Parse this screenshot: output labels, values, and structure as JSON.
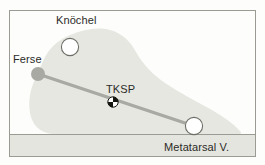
{
  "figure": {
    "kind": "anatomical-diagram",
    "labels": {
      "heel": "Ferse",
      "ankle": "Knöchel",
      "center_of_pressure": "TKSP",
      "metatarsal": "Metatarsal V."
    },
    "markers": [
      {
        "name": "heel-marker",
        "label": "Ferse",
        "style": "filled-circle",
        "x": 38,
        "y": 74,
        "r": 7
      },
      {
        "name": "ankle-marker",
        "label": "Knöchel",
        "style": "open-circle",
        "x": 70,
        "y": 47,
        "r": 9
      },
      {
        "name": "tksp-marker",
        "label": "TKSP",
        "style": "quadrant-circle",
        "x": 113,
        "y": 102,
        "r": 5
      },
      {
        "name": "metatarsal-marker",
        "label": "Metatarsal V.",
        "style": "open-circle",
        "x": 194,
        "y": 126,
        "r": 9
      }
    ],
    "axis_line": {
      "name": "heel-to-metatarsal-axis",
      "x1": 38,
      "y1": 74,
      "x2": 194,
      "y2": 126
    },
    "ground_line": {
      "name": "ground-line",
      "y": 134
    },
    "colors": {
      "background": "#fdfdfb",
      "frame": "#9b9b94",
      "foot_fill": "#e7e7e2",
      "ground_band": "#e5e5df",
      "axis_line": "#a9a9a3",
      "marker_fill": "#ffffff",
      "marker_stroke": "#6e6e68",
      "heel_fill": "#a9a9a3",
      "text": "#2b2b28"
    }
  }
}
